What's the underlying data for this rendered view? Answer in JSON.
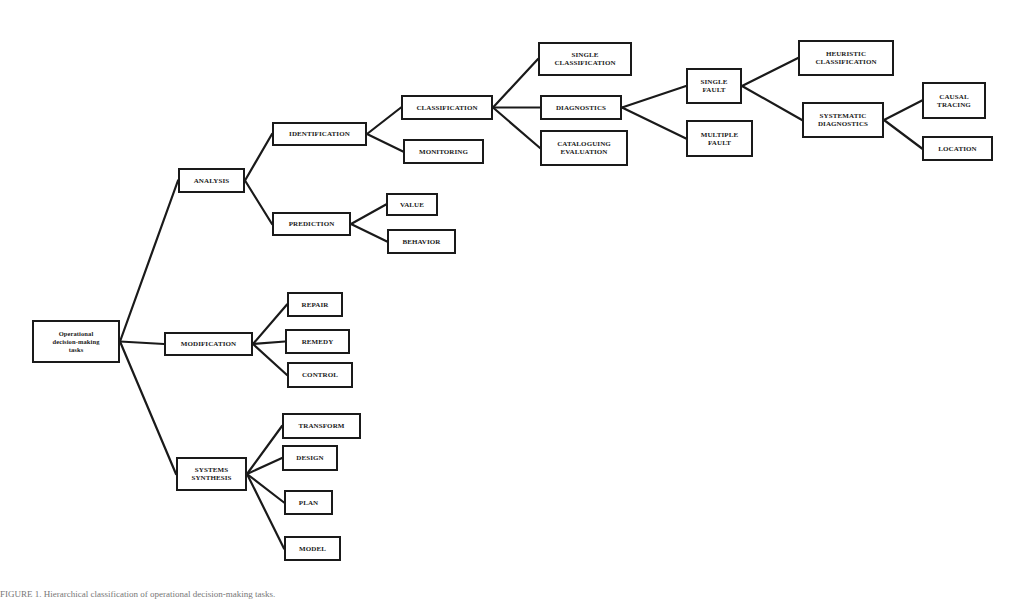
{
  "diagram": {
    "nodes": [
      {
        "id": "root",
        "label": "Operational\ndecision-making\ntasks",
        "x": 32,
        "y": 320,
        "w": 88,
        "h": 43
      },
      {
        "id": "analysis",
        "label": "ANALYSIS",
        "x": 178,
        "y": 168,
        "w": 67,
        "h": 25
      },
      {
        "id": "modification",
        "label": "MODIFICATION",
        "x": 164,
        "y": 332,
        "w": 89,
        "h": 24
      },
      {
        "id": "systems_synthesis",
        "label": "SYSTEMS\nSYNTHESIS",
        "x": 176,
        "y": 457,
        "w": 71,
        "h": 34
      },
      {
        "id": "identification",
        "label": "IDENTIFICATION",
        "x": 272,
        "y": 122,
        "w": 95,
        "h": 24
      },
      {
        "id": "prediction",
        "label": "PREDICTION",
        "x": 272,
        "y": 212,
        "w": 79,
        "h": 24
      },
      {
        "id": "classification",
        "label": "CLASSIFICATION",
        "x": 401,
        "y": 95,
        "w": 92,
        "h": 25
      },
      {
        "id": "monitoring",
        "label": "MONITORING",
        "x": 403,
        "y": 139,
        "w": 81,
        "h": 25
      },
      {
        "id": "value",
        "label": "VALUE",
        "x": 386,
        "y": 193,
        "w": 52,
        "h": 23
      },
      {
        "id": "behavior",
        "label": "BEHAVIOR",
        "x": 387,
        "y": 229,
        "w": 69,
        "h": 25
      },
      {
        "id": "single_classification",
        "label": "SINGLE\nCLASSIFICATION",
        "x": 538,
        "y": 42,
        "w": 94,
        "h": 34
      },
      {
        "id": "diagnostics",
        "label": "DIAGNOSTICS",
        "x": 540,
        "y": 95,
        "w": 82,
        "h": 25
      },
      {
        "id": "cataloguing_evaluation",
        "label": "CATALOGUING\nEVALUATION",
        "x": 540,
        "y": 130,
        "w": 88,
        "h": 36
      },
      {
        "id": "single_fault",
        "label": "SINGLE\nFAULT",
        "x": 686,
        "y": 68,
        "w": 56,
        "h": 36
      },
      {
        "id": "multiple_fault",
        "label": "MULTIPLE\nFAULT",
        "x": 686,
        "y": 120,
        "w": 67,
        "h": 37
      },
      {
        "id": "heuristic_classification",
        "label": "HEURISTIC\nCLASSIFICATION",
        "x": 798,
        "y": 40,
        "w": 96,
        "h": 36
      },
      {
        "id": "systematic_diagnostics",
        "label": "SYSTEMATIC\nDIAGNOSTICS",
        "x": 802,
        "y": 102,
        "w": 82,
        "h": 36
      },
      {
        "id": "causal_tracing",
        "label": "CAUSAL\nTRACING",
        "x": 922,
        "y": 82,
        "w": 64,
        "h": 37
      },
      {
        "id": "location",
        "label": "LOCATION",
        "x": 922,
        "y": 136,
        "w": 71,
        "h": 25
      },
      {
        "id": "repair",
        "label": "REPAIR",
        "x": 287,
        "y": 292,
        "w": 56,
        "h": 25
      },
      {
        "id": "remedy",
        "label": "REMEDY",
        "x": 285,
        "y": 329,
        "w": 65,
        "h": 25
      },
      {
        "id": "control",
        "label": "CONTROL",
        "x": 287,
        "y": 362,
        "w": 66,
        "h": 26
      },
      {
        "id": "transform",
        "label": "TRANSFORM",
        "x": 282,
        "y": 413,
        "w": 79,
        "h": 26
      },
      {
        "id": "design",
        "label": "DESIGN",
        "x": 282,
        "y": 445,
        "w": 56,
        "h": 26
      },
      {
        "id": "plan",
        "label": "PLAN",
        "x": 284,
        "y": 490,
        "w": 49,
        "h": 25
      },
      {
        "id": "model",
        "label": "MODEL",
        "x": 284,
        "y": 536,
        "w": 57,
        "h": 25
      }
    ],
    "edges": [
      [
        "root",
        "analysis"
      ],
      [
        "root",
        "modification"
      ],
      [
        "root",
        "systems_synthesis"
      ],
      [
        "analysis",
        "identification"
      ],
      [
        "analysis",
        "prediction"
      ],
      [
        "identification",
        "classification"
      ],
      [
        "identification",
        "monitoring"
      ],
      [
        "prediction",
        "value"
      ],
      [
        "prediction",
        "behavior"
      ],
      [
        "classification",
        "single_classification"
      ],
      [
        "classification",
        "diagnostics"
      ],
      [
        "classification",
        "cataloguing_evaluation"
      ],
      [
        "diagnostics",
        "single_fault"
      ],
      [
        "diagnostics",
        "multiple_fault"
      ],
      [
        "single_fault",
        "heuristic_classification"
      ],
      [
        "single_fault",
        "systematic_diagnostics"
      ],
      [
        "systematic_diagnostics",
        "causal_tracing"
      ],
      [
        "systematic_diagnostics",
        "location"
      ],
      [
        "modification",
        "repair"
      ],
      [
        "modification",
        "remedy"
      ],
      [
        "modification",
        "control"
      ],
      [
        "systems_synthesis",
        "transform"
      ],
      [
        "systems_synthesis",
        "design"
      ],
      [
        "systems_synthesis",
        "plan"
      ],
      [
        "systems_synthesis",
        "model"
      ]
    ],
    "colors": {
      "stroke": "#1a1a1a",
      "fill": "#ffffff",
      "background": "#ffffff"
    }
  },
  "caption": "FIGURE 1.  Hierarchical classification of operational decision-making tasks."
}
